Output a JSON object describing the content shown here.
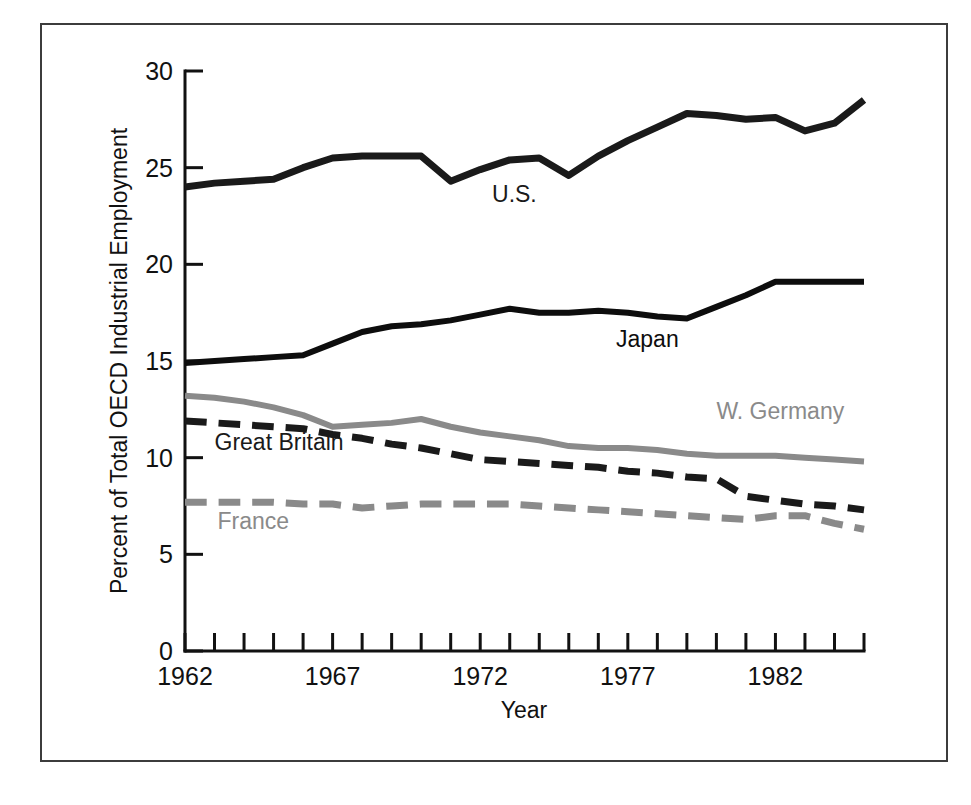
{
  "figure": {
    "kind": "line-chart",
    "frame_color": "#3c3c3c",
    "background": "#ffffff"
  },
  "chart_data": {
    "type": "line",
    "title": "",
    "xlabel": "Year",
    "ylabel": "Percent of Total OECD Industrial Employment",
    "xlim": [
      1962,
      1985
    ],
    "ylim": [
      0,
      30
    ],
    "yticks": [
      0,
      5,
      10,
      15,
      20,
      25,
      30
    ],
    "ytick_labels": [
      "0",
      "5",
      "10",
      "15",
      "20",
      "25",
      "30"
    ],
    "xticks": [
      1962,
      1963,
      1964,
      1965,
      1966,
      1967,
      1968,
      1969,
      1970,
      1971,
      1972,
      1973,
      1974,
      1975,
      1976,
      1977,
      1978,
      1979,
      1980,
      1981,
      1982,
      1983,
      1984,
      1985
    ],
    "xtick_labels_shown": [
      "1962",
      "1967",
      "1972",
      "1977",
      "1982"
    ],
    "xtick_labels_shown_at": [
      1962,
      1967,
      1972,
      1977,
      1982
    ],
    "grid": false,
    "legend_position": "inline-annotations",
    "x": [
      1962,
      1963,
      1964,
      1965,
      1966,
      1967,
      1968,
      1969,
      1970,
      1971,
      1972,
      1973,
      1974,
      1975,
      1976,
      1977,
      1978,
      1979,
      1980,
      1981,
      1982,
      1983,
      1984,
      1985
    ],
    "series": [
      {
        "name": "U.S.",
        "color": "#1a1a1a",
        "style": "solid",
        "width": 7,
        "label_x": 1972.4,
        "label_y": 23.2,
        "values": [
          24.0,
          24.2,
          24.3,
          24.4,
          25.0,
          25.5,
          25.6,
          25.6,
          25.6,
          24.3,
          24.9,
          25.4,
          25.5,
          24.6,
          25.6,
          26.4,
          27.1,
          27.8,
          27.7,
          27.5,
          27.6,
          26.9,
          27.3,
          28.5
        ]
      },
      {
        "name": "Japan",
        "color": "#0d0d0d",
        "style": "solid",
        "width": 6,
        "label_x": 1976.6,
        "label_y": 15.7,
        "values": [
          14.9,
          15.0,
          15.1,
          15.2,
          15.3,
          15.9,
          16.5,
          16.8,
          16.9,
          17.1,
          17.4,
          17.7,
          17.5,
          17.5,
          17.6,
          17.5,
          17.3,
          17.2,
          17.8,
          18.4,
          19.1,
          19.1,
          19.1,
          19.1
        ]
      },
      {
        "name": "W. Germany",
        "color": "#8a8a8a",
        "style": "solid",
        "width": 6,
        "label_x": 1980.0,
        "label_y": 12.0,
        "values": [
          13.2,
          13.1,
          12.9,
          12.6,
          12.2,
          11.6,
          11.7,
          11.8,
          12.0,
          11.6,
          11.3,
          11.1,
          10.9,
          10.6,
          10.5,
          10.5,
          10.4,
          10.2,
          10.1,
          10.1,
          10.1,
          10.0,
          9.9,
          9.8
        ]
      },
      {
        "name": "Great Britain",
        "color": "#1a1a1a",
        "style": "dashed",
        "width": 7,
        "label_x": 1963.0,
        "label_y": 10.4,
        "values": [
          11.9,
          11.8,
          11.7,
          11.6,
          11.5,
          11.2,
          11.0,
          10.7,
          10.5,
          10.2,
          9.9,
          9.8,
          9.7,
          9.6,
          9.5,
          9.3,
          9.2,
          9.0,
          8.9,
          8.0,
          7.8,
          7.6,
          7.5,
          7.3
        ]
      },
      {
        "name": "France",
        "color": "#8a8a8a",
        "style": "dashed",
        "width": 7,
        "label_x": 1963.1,
        "label_y": 6.3,
        "values": [
          7.7,
          7.7,
          7.7,
          7.7,
          7.6,
          7.6,
          7.4,
          7.5,
          7.6,
          7.6,
          7.6,
          7.6,
          7.5,
          7.4,
          7.3,
          7.2,
          7.1,
          7.0,
          6.9,
          6.8,
          7.0,
          7.0,
          6.6,
          6.3
        ]
      }
    ]
  }
}
